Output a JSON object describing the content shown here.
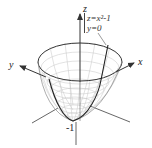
{
  "figure": {
    "labels": {
      "z_axis": "z",
      "x_axis": "x",
      "y_axis": "y",
      "vertex_value": "-1"
    },
    "annotation": {
      "line1": "z=x²-1",
      "line2": "y=0"
    },
    "colors": {
      "mesh": "#bdbdbd",
      "outline": "#333333",
      "axes": "#444444",
      "background": "#ffffff"
    }
  }
}
